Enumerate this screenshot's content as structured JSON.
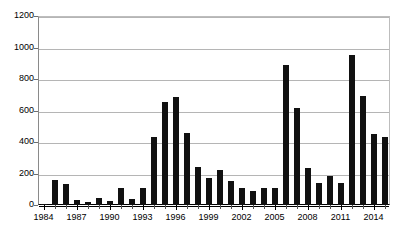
{
  "chart_data": {
    "type": "bar",
    "title": "",
    "subtitle": "",
    "xlabel": "",
    "ylabel": "",
    "categories": [
      "1984",
      "1985",
      "1986",
      "1987",
      "1988",
      "1989",
      "1990",
      "1991",
      "1992",
      "1993",
      "1994",
      "1995",
      "1996",
      "1997",
      "1998",
      "1999",
      "2000",
      "2001",
      "2002",
      "2003",
      "2004",
      "2005",
      "2006",
      "2007",
      "2008",
      "2009",
      "2010",
      "2011",
      "2012",
      "2013",
      "2014",
      "2015"
    ],
    "values": [
      5,
      160,
      135,
      32,
      20,
      45,
      28,
      107,
      40,
      110,
      432,
      655,
      687,
      457,
      243,
      173,
      220,
      155,
      110,
      92,
      105,
      110,
      888,
      618,
      237,
      142,
      186,
      138,
      950,
      690,
      448,
      432
    ],
    "ylim": [
      0,
      1200
    ],
    "ytick_values": [
      0,
      200,
      400,
      600,
      800,
      1000,
      1200
    ],
    "ytick_labels": [
      "0",
      "200",
      "400",
      "600",
      "800",
      "1000",
      "1200"
    ],
    "xtick_labels": [
      "1984",
      "1987",
      "1990",
      "1993",
      "1996",
      "1999",
      "2002",
      "2005",
      "2008",
      "2011",
      "2014"
    ],
    "xtick_label_step": 3,
    "grid": true,
    "grid_axis": "y",
    "legend": false,
    "legend_position": "none",
    "bar_color": "#111111",
    "grid_color": "#b5b5b5",
    "axis_color": "#000000",
    "background_color": "#ffffff"
  }
}
